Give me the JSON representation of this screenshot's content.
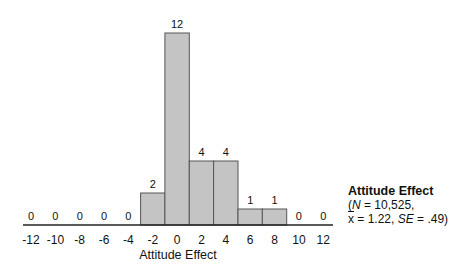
{
  "chart_data": {
    "type": "bar",
    "title": "Attitude Effect",
    "xlabel": "Attitude Effect",
    "ylabel": "",
    "categories": [
      "-12",
      "-10",
      "-8",
      "-6",
      "-4",
      "-2",
      "0",
      "2",
      "4",
      "6",
      "8",
      "10",
      "12"
    ],
    "values": [
      0,
      0,
      0,
      0,
      0,
      2,
      12,
      4,
      4,
      1,
      1,
      0,
      0
    ],
    "data_labels": true,
    "ylim": [
      0,
      12
    ],
    "grid": false,
    "y_axis_visible": false,
    "bar_color": "#c4c4c4",
    "bar_edge_color": "#555555",
    "annotation": {
      "title": "Attitude Effect",
      "line1_prefix": "(",
      "N_label": "N",
      "N_value": " = 10,525,",
      "mean_label": "x",
      "mean_value": " = 1.22, ",
      "SE_label": "SE",
      "SE_value": " = .49)"
    },
    "legend_position": "right"
  }
}
